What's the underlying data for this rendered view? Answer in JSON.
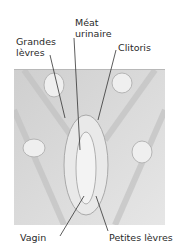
{
  "figure": {
    "type": "labeled anatomical illustration (pencil shading, grayscale)",
    "labels": [
      {
        "id": "grandes-levres",
        "text": "Grandes\nlèvres",
        "line1": "Grandes",
        "line2": "lèvres"
      },
      {
        "id": "meat-urinaire",
        "text": "Méat\nurinaire",
        "line1": "Méat",
        "line2": "urinaire"
      },
      {
        "id": "clitoris",
        "text": "Clitoris"
      },
      {
        "id": "vagin",
        "text": "Vagin"
      },
      {
        "id": "petites-levres",
        "text": "Petites lèvres"
      }
    ],
    "colors": {
      "background": "#ffffff",
      "illustration": "#dcdcdc",
      "shading": "#bdbdbd",
      "highlight": "#f2f2f2",
      "leader_lines": "#333333",
      "text": "#2a2a2a"
    }
  }
}
